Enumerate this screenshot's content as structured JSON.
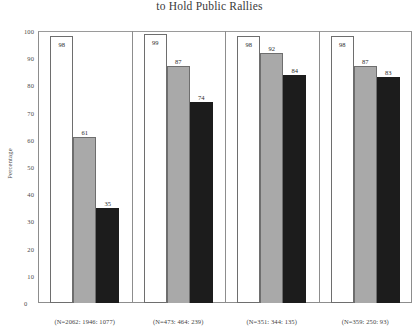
{
  "chart_data": {
    "type": "bar",
    "title": "to Hold Public Rallies",
    "xlabel": "",
    "ylabel": "Percentage",
    "ylim": [
      0,
      100
    ],
    "yticks": [
      0,
      10,
      20,
      30,
      40,
      50,
      60,
      70,
      80,
      90,
      100
    ],
    "grid": false,
    "legend": "none",
    "categories": [
      "(N=2062: 1946: 1077)",
      "(N=473: 464: 239)",
      "(N=351: 344: 135)",
      "(N=359: 250: 93)"
    ],
    "series": [
      {
        "name": "series-1",
        "color": "#ffffff",
        "values": [
          98,
          99,
          98,
          98
        ]
      },
      {
        "name": "series-2",
        "color": "#a9a9a9",
        "values": [
          61,
          87,
          92,
          87
        ]
      },
      {
        "name": "series-3",
        "color": "#1c1c1c",
        "values": [
          35,
          74,
          84,
          83
        ]
      }
    ]
  },
  "axis": {
    "y_title": "Percentage",
    "y_tick_labels": [
      "100",
      "90",
      "80",
      "70",
      "60",
      "50",
      "40",
      "30",
      "20",
      "10"
    ],
    "zero_label": "0"
  },
  "groups": [
    {
      "label": "(N=2062: 1946: 1077)",
      "bars": [
        {
          "value": 98,
          "label": "98",
          "style": "white"
        },
        {
          "value": 61,
          "label": "61",
          "style": "gray"
        },
        {
          "value": 35,
          "label": "35",
          "style": "black"
        }
      ]
    },
    {
      "label": "(N=473: 464: 239)",
      "bars": [
        {
          "value": 99,
          "label": "99",
          "style": "white"
        },
        {
          "value": 87,
          "label": "87",
          "style": "gray"
        },
        {
          "value": 74,
          "label": "74",
          "style": "black"
        }
      ]
    },
    {
      "label": "(N=351: 344: 135)",
      "bars": [
        {
          "value": 98,
          "label": "98",
          "style": "white"
        },
        {
          "value": 92,
          "label": "92",
          "style": "gray"
        },
        {
          "value": 84,
          "label": "84",
          "style": "black"
        }
      ]
    },
    {
      "label": "(N=359: 250: 93)",
      "bars": [
        {
          "value": 98,
          "label": "98",
          "style": "white"
        },
        {
          "value": 87,
          "label": "87",
          "style": "gray"
        },
        {
          "value": 83,
          "label": "83",
          "style": "black"
        }
      ]
    }
  ],
  "colors": {
    "series_white": "#ffffff",
    "series_gray": "#a9a9a9",
    "series_black": "#1c1c1c",
    "frame": "#8d8d8d",
    "text": "#2b2b2b"
  }
}
